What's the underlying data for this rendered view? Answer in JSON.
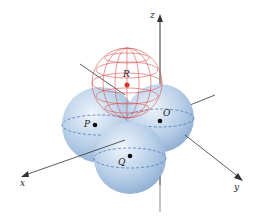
{
  "figure": {
    "type": "3d-sphere-diagram",
    "axes": {
      "x": "x",
      "y": "y",
      "z": "z"
    },
    "points": [
      {
        "label": "R",
        "description": "center of red wireframe sphere on top"
      },
      {
        "label": "P",
        "description": "center of left blue sphere"
      },
      {
        "label": "O",
        "description": "center of right blue sphere"
      },
      {
        "label": "Q",
        "description": "center of front blue sphere"
      }
    ],
    "colors": {
      "blue_sphere": "#a9c4e2",
      "wire_sphere": "#d9534f",
      "axis": "#333333"
    }
  }
}
